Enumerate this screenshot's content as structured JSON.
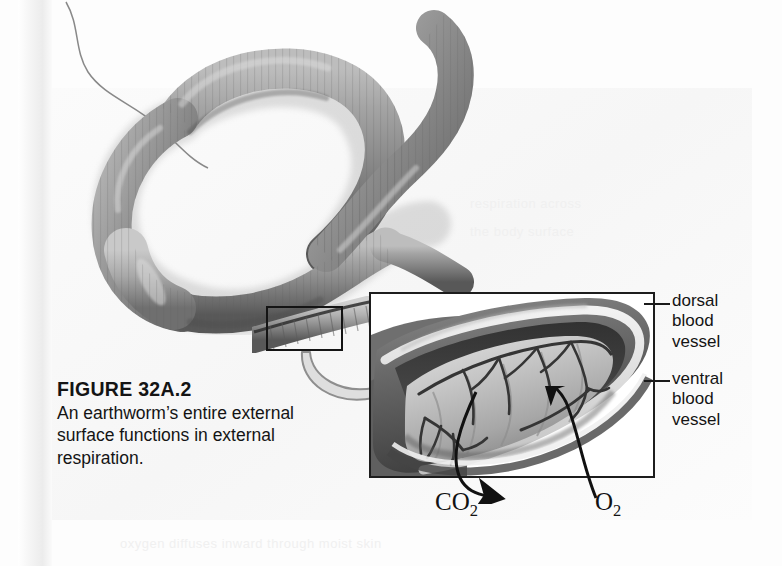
{
  "figure": {
    "number": "FIGURE 32A.2",
    "caption": "An earthworm’s entire external surface functions in external respiration."
  },
  "labels": {
    "dorsal": "dorsal\nblood\nvessel",
    "ventral": "ventral\nblood\nvessel",
    "carbon_dioxide": "CO",
    "carbon_dioxide_sub": "2",
    "oxygen": "O",
    "oxygen_sub": "2"
  },
  "icons": {
    "zoom_arrow": "curved-magnify-arrow-icon",
    "co2_arrow": "co2-outflow-arrow-icon",
    "o2_arrow": "o2-inflow-arrow-icon",
    "dorsal_leader": "leader-line-icon",
    "ventral_leader": "leader-line-icon"
  },
  "artwork": {
    "worm_photo": "earthworm-photograph",
    "inset_illustration": "earthworm-segment-cutaway-illustration",
    "detail_box": "detail-region-rectangle"
  },
  "colors": {
    "page_background": "#fdfdfd",
    "ink": "#141414",
    "rule": "#1d1d1d",
    "worm_body": "#8e8e8e",
    "worm_shadow": "#5a5a5a",
    "inset_flesh": "#bdbdbd",
    "vessel": "#3a3a3a",
    "zoom_arrow_fill": "#d9d9d9"
  }
}
